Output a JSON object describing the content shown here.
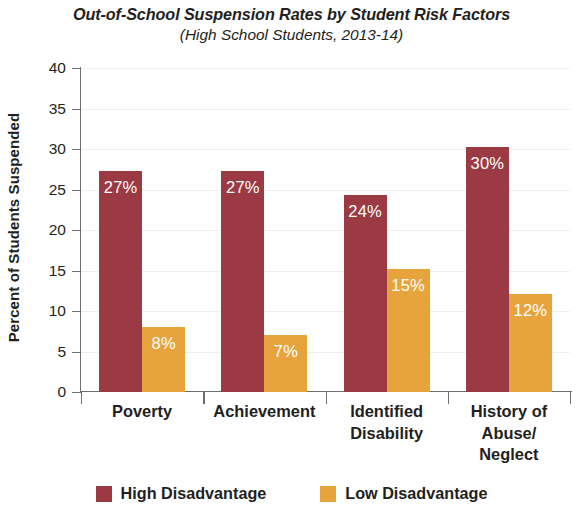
{
  "chart_data": {
    "type": "bar",
    "title": "Out-of-School Suspension Rates by Student Risk Factors",
    "subtitle": "(High School Students, 2013-14)",
    "xlabel": "",
    "ylabel": "Percent of Students Suspended",
    "ylim": [
      0,
      40
    ],
    "yticks": [
      0,
      5,
      10,
      15,
      20,
      25,
      30,
      35,
      40
    ],
    "ytick_labels": [
      "0",
      "5",
      "10",
      "15",
      "20",
      "25",
      "30",
      "35",
      "40"
    ],
    "grid": true,
    "legend_position": "bottom",
    "categories": [
      "Poverty",
      "Achievement",
      "Identified Disability",
      "History of Abuse/ Neglect"
    ],
    "category_lines": [
      [
        "Poverty"
      ],
      [
        "Achievement"
      ],
      [
        "Identified",
        "Disability"
      ],
      [
        "History of",
        "Abuse/",
        "Neglect"
      ]
    ],
    "series": [
      {
        "name": "High Disadvantage",
        "color": "#9c3a44",
        "values": [
          27.3,
          27.3,
          24.3,
          30.2
        ],
        "data_labels": [
          "27%",
          "27%",
          "24%",
          "30%"
        ]
      },
      {
        "name": "Low Disadvantage",
        "color": "#e8a43c",
        "values": [
          8.0,
          7.0,
          15.2,
          12.1
        ],
        "data_labels": [
          "8%",
          "7%",
          "15%",
          "12%"
        ]
      }
    ]
  },
  "legend": [
    {
      "label": "High Disadvantage",
      "color": "#9c3a44"
    },
    {
      "label": "Low Disadvantage",
      "color": "#e8a43c"
    }
  ],
  "colors": {
    "high_disadvantage": "#9c3a44",
    "low_disadvantage": "#e8a43c",
    "axis": "#6d6e70",
    "grid": "#f1eeee",
    "text": "#231f20",
    "data_label_text": "#ffffff",
    "background": "#ffffff"
  }
}
